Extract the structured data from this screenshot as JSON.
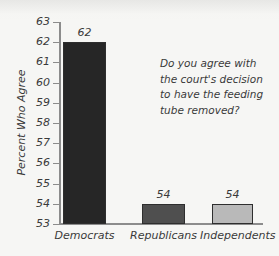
{
  "chart_data": {
    "type": "bar",
    "title": "",
    "subtitle": "",
    "xlabel": "",
    "ylabel": "Percent Who Agree",
    "categories": [
      "Democrats",
      "Republicans",
      "Independents"
    ],
    "values": [
      62,
      54,
      54
    ],
    "value_labels": [
      "62",
      "54",
      "54"
    ],
    "ylim": [
      53,
      63
    ],
    "y_ticks": [
      53,
      54,
      55,
      56,
      57,
      58,
      59,
      60,
      61,
      62,
      63
    ],
    "y_tick_labels": [
      "53",
      "54",
      "55",
      "56",
      "57",
      "58",
      "59",
      "60",
      "61",
      "62",
      "63"
    ],
    "grid": false,
    "legend": false,
    "legend_position": "none",
    "bar_colors": [
      "#262626",
      "#4f4f4f",
      "#b9b9b9"
    ],
    "bar_edge_color": "#2e2e2e",
    "annotations": [
      {
        "name": "question-annotation",
        "text": "Do you agree with the court's decision to have the feeding tube removed?"
      }
    ]
  },
  "figure": {
    "background_color": "#f6f6f4",
    "axis_color": "#8c8c8c",
    "text_color": "#3a3a3a"
  }
}
